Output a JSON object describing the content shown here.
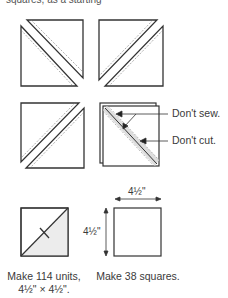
{
  "clipped_header": "squares, as a starting",
  "annotations": {
    "dont_sew": "Don't sew.",
    "dont_cut": "Don't cut."
  },
  "dimensions": {
    "width": "4½\"",
    "height": "4½\""
  },
  "captions": {
    "units_line1": "Make 114 units,",
    "units_line2": "4½\" × 4½\".",
    "squares": "Make 38 squares."
  }
}
